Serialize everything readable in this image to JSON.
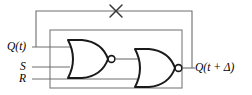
{
  "figure": {
    "type": "logic-circuit-diagram",
    "background_color": "#ffffff",
    "gate_stroke_color": "#1a1a1a",
    "wire_stroke_color": "#6e6e6e",
    "box_stroke_color": "#7a7a7a",
    "label_color": "#000000"
  },
  "labels": {
    "input_q": "Q(t)",
    "input_s": "S",
    "input_r": "R",
    "output_q_next": "Q(t + Δ)"
  },
  "annotations": {
    "cross_mark": "×",
    "cross_mark_name": "feedback-crossed-out"
  },
  "gates": [
    {
      "id": "gate-1",
      "type": "NOR",
      "inputs": [
        "Q(t)",
        "S"
      ],
      "output": "internal-node"
    },
    {
      "id": "gate-2",
      "type": "NOR",
      "inputs": [
        "internal-node",
        "R"
      ],
      "output": "Q(t + Δ)"
    }
  ],
  "wires": [
    {
      "id": "wire-q-in",
      "from": "Q(t)",
      "to": "gate-1.input-a"
    },
    {
      "id": "wire-s-in",
      "from": "S",
      "to": "gate-1.input-b"
    },
    {
      "id": "wire-r-in",
      "from": "R",
      "to": "gate-2.input-b"
    },
    {
      "id": "wire-internal",
      "from": "gate-1.output",
      "to": "gate-2.input-a"
    },
    {
      "id": "wire-out",
      "from": "gate-2.output",
      "to": "Q(t + Δ)"
    },
    {
      "id": "wire-feedback",
      "from": "Q(t + Δ)",
      "to": "Q(t)",
      "crossed_out": true
    }
  ]
}
